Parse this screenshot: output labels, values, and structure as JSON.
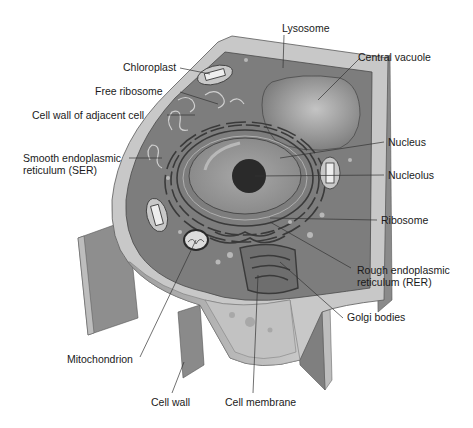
{
  "labels": {
    "lysosome": "Lysosome",
    "central_vacuole": "Central vacuole",
    "chloroplast": "Chloroplast",
    "free_ribosome": "Free ribosome",
    "cell_wall_adjacent": "Cell wall of adjacent cell",
    "ser": "Smooth endoplasmic\nreticulum (SER)",
    "nucleus": "Nucleus",
    "nucleolus": "Nucleolus",
    "ribosome": "Ribosome",
    "rer": "Rough endoplasmic\nreticulum (RER)",
    "golgi": "Golgi bodies",
    "mitochondrion": "Mitochondrion",
    "cell_wall": "Cell wall",
    "cell_membrane": "Cell membrane"
  },
  "colors": {
    "background": "#ffffff",
    "cytoplasm": "#7d7d7d",
    "cell_wall": "#c9c9c9",
    "wall_side": "#8a8a8a",
    "vacuole": "#9a9a9a",
    "nucleus": "#8f8f8f",
    "nucleolus": "#2a2a2a",
    "cut_face": "#b8b8b8"
  }
}
